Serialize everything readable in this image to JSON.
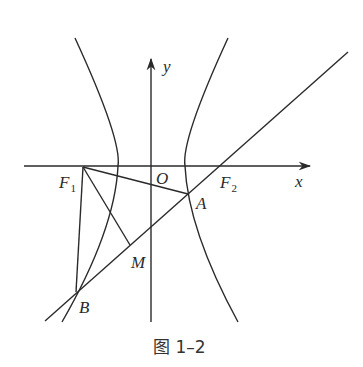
{
  "figure": {
    "caption": "图 1–2",
    "axes": {
      "x_label": "x",
      "y_label": "y",
      "origin_label": "O"
    },
    "points": {
      "F1": {
        "name": "F",
        "sub": "1"
      },
      "F2": {
        "name": "F",
        "sub": "2"
      },
      "A": {
        "name": "A"
      },
      "B": {
        "name": "B"
      },
      "M": {
        "name": "M"
      }
    },
    "elements": [
      "hyperbola with two branches (left and right), foci F1, F2 on x-axis",
      "line through B, A, F2",
      "segment F1A",
      "segment F1B",
      "segment F1M (perpendicular to line AB at M)",
      "left branch passes through B"
    ],
    "colors": {
      "stroke": "#2a2a2a",
      "background": "#ffffff"
    }
  }
}
